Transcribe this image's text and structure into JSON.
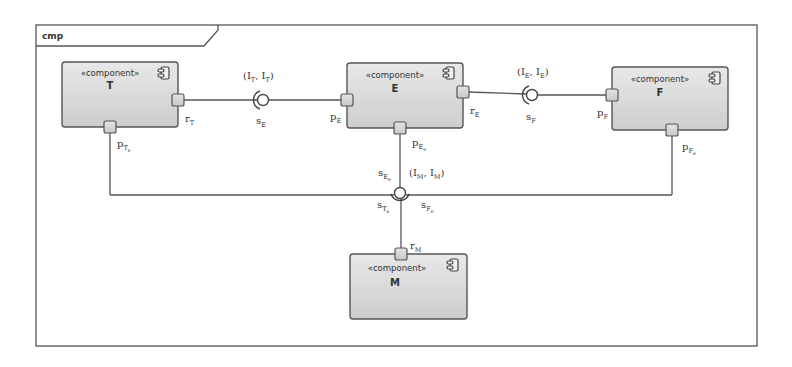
{
  "frame": {
    "title": "cmp"
  },
  "components": [
    {
      "id": "T",
      "stereotype": "«component»",
      "name": "T"
    },
    {
      "id": "E",
      "stereotype": "«component»",
      "name": "E"
    },
    {
      "id": "F",
      "stereotype": "«component»",
      "name": "F"
    },
    {
      "id": "M",
      "stereotype": "«component»",
      "name": "M"
    }
  ],
  "ports": {
    "rT": {
      "base": "r",
      "sub": "T"
    },
    "pTe": {
      "base": "p",
      "sub": "T",
      "subsub": "e"
    },
    "pE": {
      "base": "p",
      "sub": "E"
    },
    "rE": {
      "base": "r",
      "sub": "E"
    },
    "pEe": {
      "base": "p",
      "sub": "E",
      "subsub": "e"
    },
    "pF": {
      "base": "p",
      "sub": "F"
    },
    "pFe": {
      "base": "p",
      "sub": "F",
      "subsub": "e"
    },
    "rM": {
      "base": "r",
      "sub": "M"
    }
  },
  "connectors": {
    "sE": {
      "base": "s",
      "sub": "E"
    },
    "sF": {
      "base": "s",
      "sub": "F"
    },
    "sEe": {
      "base": "s",
      "sub": "E",
      "subsub": "e"
    },
    "sTe": {
      "base": "s",
      "sub": "T",
      "subsub": "e"
    },
    "sFe": {
      "base": "s",
      "sub": "F",
      "subsub": "e"
    }
  },
  "interfaces": {
    "TT": {
      "open": "(",
      "a": "I",
      "a_sub": "T",
      "sep": ", ",
      "b": "I",
      "b_sub": "T",
      "close": ")"
    },
    "EE": {
      "open": "(",
      "a": "I",
      "a_sub": "E",
      "sep": ", ",
      "b": "I",
      "b_sub": "E",
      "close": ")"
    },
    "MM": {
      "open": "(",
      "a": "I",
      "a_sub": "M",
      "sep": ", ",
      "b": "I",
      "b_sub": "M",
      "close": ")"
    }
  },
  "colors": {
    "frame_stroke": "#555555",
    "box_fill_top": "#e6e6e6",
    "box_fill_bottom": "#cfcfcf",
    "box_stroke": "#555555",
    "port_fill": "#d9d9d9",
    "line": "#555555"
  }
}
